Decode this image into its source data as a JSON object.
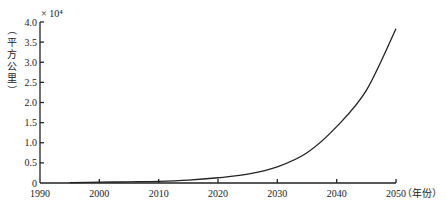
{
  "chart_data": {
    "type": "line",
    "title": "",
    "xlabel": "（年份）",
    "ylabel": "（平方公里）",
    "y_multiplier": "× 10⁴",
    "xlim": [
      1990,
      2050
    ],
    "ylim": [
      0,
      4.0
    ],
    "x_ticks": [
      1990,
      2000,
      2010,
      2020,
      2030,
      2040,
      2050
    ],
    "x_tick_labels": [
      "1990",
      "2000",
      "2010",
      "2020",
      "2030",
      "2040",
      "2050"
    ],
    "y_ticks": [
      0,
      0.5,
      1.0,
      1.5,
      2.0,
      2.5,
      3.0,
      3.5,
      4.0
    ],
    "y_tick_labels": [
      "0",
      "0.5",
      "1.0",
      "1.5",
      "2.0",
      "2.5",
      "3.0",
      "3.5",
      "4.0"
    ],
    "grid": false,
    "legend": null,
    "series": [
      {
        "name": "area",
        "x": [
          1995,
          2000,
          2005,
          2010,
          2015,
          2020,
          2025,
          2030,
          2035,
          2040,
          2045,
          2050
        ],
        "values": [
          0.01,
          0.02,
          0.03,
          0.04,
          0.07,
          0.13,
          0.22,
          0.4,
          0.75,
          1.4,
          2.3,
          3.83
        ]
      }
    ]
  }
}
